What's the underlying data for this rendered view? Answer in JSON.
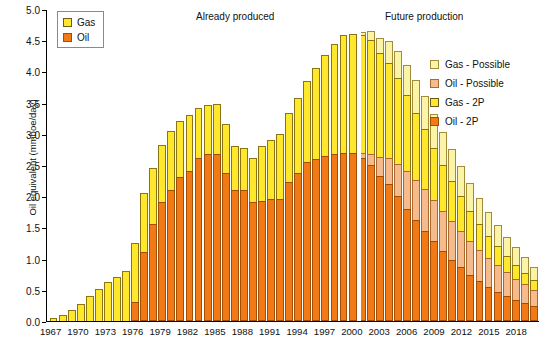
{
  "chart_data": {
    "type": "bar",
    "title": "",
    "xlabel": "",
    "ylabel": "Oil equivalent (mmboe/day)",
    "ylim": [
      0.0,
      5.0
    ],
    "ytick_labels": [
      "0.0",
      "0.5",
      "1.0",
      "1.5",
      "2.0",
      "2.5",
      "3.0",
      "3.5",
      "4.0",
      "4.5",
      "5.0"
    ],
    "ytick_values": [
      0.0,
      0.5,
      1.0,
      1.5,
      2.0,
      2.5,
      3.0,
      3.5,
      4.0,
      4.5,
      5.0
    ],
    "grid": false,
    "stacked": true,
    "legend_position": "top-left and right",
    "xtick_labels": [
      "1967",
      "1970",
      "1973",
      "1976",
      "1979",
      "1982",
      "1985",
      "1988",
      "1991",
      "1994",
      "1997",
      "2000",
      "2003",
      "2006",
      "2009",
      "2012",
      "2015",
      "2018"
    ],
    "categories": [
      1967,
      1968,
      1969,
      1970,
      1971,
      1972,
      1973,
      1974,
      1975,
      1976,
      1977,
      1978,
      1979,
      1980,
      1981,
      1982,
      1983,
      1984,
      1985,
      1986,
      1987,
      1988,
      1989,
      1990,
      1991,
      1992,
      1993,
      1994,
      1995,
      1996,
      1997,
      1998,
      1999,
      2000,
      2001,
      2002,
      2003,
      2004,
      2005,
      2006,
      2007,
      2008,
      2009,
      2010,
      2011,
      2012,
      2013,
      2014,
      2015,
      2016,
      2017,
      2018,
      2019,
      2020
    ],
    "series": [
      {
        "name": "Oil - 2P",
        "color": "#f17a17",
        "values": [
          0.0,
          0.0,
          0.0,
          0.0,
          0.0,
          0.0,
          0.0,
          0.0,
          0.0,
          0.3,
          1.1,
          1.55,
          1.9,
          2.1,
          2.3,
          2.4,
          2.62,
          2.68,
          2.68,
          2.38,
          2.1,
          2.1,
          1.9,
          1.92,
          1.95,
          1.96,
          2.22,
          2.38,
          2.55,
          2.6,
          2.65,
          2.68,
          2.7,
          2.7,
          2.62,
          2.5,
          2.33,
          2.2,
          2.0,
          1.8,
          1.62,
          1.45,
          1.28,
          1.12,
          0.98,
          0.86,
          0.74,
          0.64,
          0.55,
          0.47,
          0.4,
          0.34,
          0.29,
          0.24
        ]
      },
      {
        "name": "Oil - Possible",
        "color": "#f6bb8c",
        "values": [
          0.0,
          0.0,
          0.0,
          0.0,
          0.0,
          0.0,
          0.0,
          0.0,
          0.0,
          0.0,
          0.0,
          0.0,
          0.0,
          0.0,
          0.0,
          0.0,
          0.0,
          0.0,
          0.0,
          0.0,
          0.0,
          0.0,
          0.0,
          0.0,
          0.0,
          0.0,
          0.0,
          0.0,
          0.0,
          0.0,
          0.0,
          0.0,
          0.0,
          0.0,
          0.08,
          0.18,
          0.3,
          0.42,
          0.52,
          0.6,
          0.64,
          0.66,
          0.66,
          0.64,
          0.62,
          0.58,
          0.54,
          0.5,
          0.46,
          0.42,
          0.38,
          0.34,
          0.3,
          0.26
        ]
      },
      {
        "name": "Gas - 2P",
        "color": "#ffe72b",
        "values": [
          0.05,
          0.1,
          0.18,
          0.28,
          0.4,
          0.52,
          0.62,
          0.7,
          0.8,
          0.95,
          0.95,
          0.9,
          0.92,
          0.95,
          0.9,
          0.9,
          0.8,
          0.78,
          0.8,
          0.78,
          0.7,
          0.68,
          0.72,
          0.88,
          0.95,
          1.04,
          1.12,
          1.2,
          1.3,
          1.46,
          1.62,
          1.76,
          1.88,
          1.9,
          1.88,
          1.82,
          1.66,
          1.52,
          1.38,
          1.22,
          1.08,
          0.96,
          0.84,
          0.74,
          0.64,
          0.56,
          0.48,
          0.42,
          0.36,
          0.31,
          0.26,
          0.22,
          0.18,
          0.15
        ]
      },
      {
        "name": "Gas - Possible",
        "color": "#fbf3a6",
        "values": [
          0.0,
          0.0,
          0.0,
          0.0,
          0.0,
          0.0,
          0.0,
          0.0,
          0.0,
          0.0,
          0.0,
          0.0,
          0.0,
          0.0,
          0.0,
          0.0,
          0.0,
          0.0,
          0.0,
          0.0,
          0.0,
          0.0,
          0.0,
          0.0,
          0.0,
          0.0,
          0.0,
          0.0,
          0.0,
          0.0,
          0.0,
          0.0,
          0.0,
          0.0,
          0.06,
          0.14,
          0.24,
          0.34,
          0.42,
          0.48,
          0.52,
          0.54,
          0.54,
          0.53,
          0.51,
          0.48,
          0.45,
          0.41,
          0.38,
          0.34,
          0.31,
          0.28,
          0.25,
          0.22
        ]
      }
    ],
    "annotations": [
      {
        "text": "Already produced",
        "x": 1989
      },
      {
        "text": "Future production",
        "x": 2009
      }
    ],
    "divider_year": 2001
  },
  "legend_main": {
    "items": [
      {
        "label": "Gas",
        "swatch": "sw-gas"
      },
      {
        "label": "Oil",
        "swatch": "sw-oil"
      }
    ]
  },
  "legend_right": {
    "items": [
      {
        "label": "Gas - Possible",
        "swatch": "sw-gas-poss"
      },
      {
        "label": "Oil - Possible",
        "swatch": "sw-oil-poss"
      },
      {
        "label": "Gas - 2P",
        "swatch": "sw-gas"
      },
      {
        "label": "Oil - 2P",
        "swatch": "sw-oil"
      }
    ]
  }
}
